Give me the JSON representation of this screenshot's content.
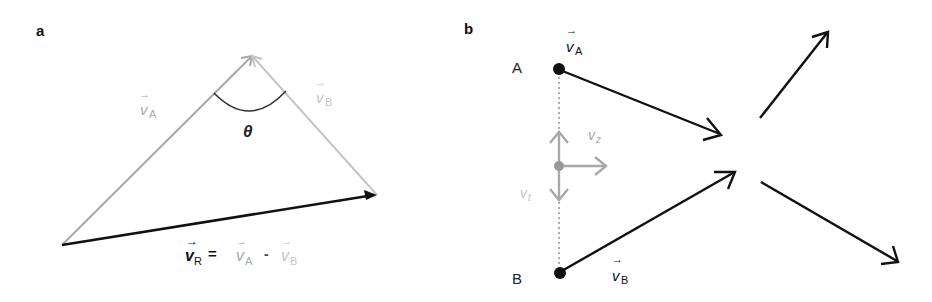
{
  "panel_a": {
    "label": "a",
    "angle_label": "θ",
    "vector_a": {
      "symbol": "v",
      "sub": "A",
      "arrow": "→"
    },
    "vector_b": {
      "symbol": "v",
      "sub": "B",
      "arrow": "→"
    },
    "formula": {
      "lhs_symbol": "v",
      "lhs_sub": "R",
      "equals": "=",
      "term1_symbol": "v",
      "term1_sub": "A",
      "minus": "-",
      "term2_symbol": "v",
      "term2_sub": "B",
      "arrow": "→"
    }
  },
  "panel_b": {
    "label": "b",
    "point_a": "A",
    "point_b": "B",
    "vector_a": {
      "symbol": "v",
      "sub": "A",
      "arrow": "→"
    },
    "vector_b": {
      "symbol": "v",
      "sub": "B",
      "arrow": "→"
    },
    "vz": {
      "symbol": "v",
      "sub": "z"
    },
    "vt": {
      "symbol": "v",
      "sub": "t"
    }
  },
  "colors": {
    "black": "#111111",
    "gray": "#a8a8a8",
    "light_gray": "#c4c4c4"
  }
}
